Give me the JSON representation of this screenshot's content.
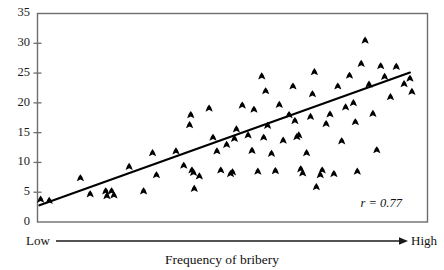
{
  "chart_data": {
    "type": "scatter",
    "title": "",
    "xlabel": "Frequency of bribery",
    "ylabel": "",
    "xlim": [
      0,
      100
    ],
    "ylim": [
      0,
      35
    ],
    "grid": false,
    "legend": null,
    "x_axis_low_label": "Low",
    "x_axis_high_label": "High",
    "y_ticks": [
      0,
      5,
      10,
      15,
      20,
      25,
      30,
      35
    ],
    "y_tick_labels": [
      "0",
      "5",
      "10",
      "15",
      "20",
      "25",
      "30",
      "35"
    ],
    "annotations": [
      {
        "name": "correlation",
        "text": "r = 0.77",
        "value": 0.77
      }
    ],
    "trendline": {
      "type": "linear",
      "x_start": 0.5,
      "y_start": 2.8,
      "x_end": 95.5,
      "y_end": 25.1
    },
    "points": [
      {
        "x": 0.8,
        "y": 3.8
      },
      {
        "x": 3.0,
        "y": 3.6
      },
      {
        "x": 11.0,
        "y": 7.4
      },
      {
        "x": 13.5,
        "y": 4.7
      },
      {
        "x": 17.5,
        "y": 5.2
      },
      {
        "x": 17.8,
        "y": 4.4
      },
      {
        "x": 19.0,
        "y": 5.2
      },
      {
        "x": 19.6,
        "y": 4.5
      },
      {
        "x": 23.5,
        "y": 9.3
      },
      {
        "x": 27.2,
        "y": 5.2
      },
      {
        "x": 29.5,
        "y": 11.6
      },
      {
        "x": 30.5,
        "y": 7.9
      },
      {
        "x": 35.5,
        "y": 11.9
      },
      {
        "x": 37.5,
        "y": 9.5
      },
      {
        "x": 39.0,
        "y": 16.3
      },
      {
        "x": 39.3,
        "y": 18.0
      },
      {
        "x": 39.6,
        "y": 8.7
      },
      {
        "x": 40.0,
        "y": 8.3
      },
      {
        "x": 40.2,
        "y": 5.6
      },
      {
        "x": 41.5,
        "y": 7.7
      },
      {
        "x": 44.0,
        "y": 19.1
      },
      {
        "x": 45.0,
        "y": 14.2
      },
      {
        "x": 46.0,
        "y": 11.9
      },
      {
        "x": 47.0,
        "y": 8.7
      },
      {
        "x": 48.5,
        "y": 13.0
      },
      {
        "x": 49.5,
        "y": 8.1
      },
      {
        "x": 50.0,
        "y": 8.4
      },
      {
        "x": 50.5,
        "y": 14.0
      },
      {
        "x": 51.0,
        "y": 15.6
      },
      {
        "x": 52.5,
        "y": 19.6
      },
      {
        "x": 54.0,
        "y": 14.6
      },
      {
        "x": 55.0,
        "y": 12.0
      },
      {
        "x": 55.5,
        "y": 18.9
      },
      {
        "x": 56.5,
        "y": 8.5
      },
      {
        "x": 57.5,
        "y": 24.5
      },
      {
        "x": 58.0,
        "y": 14.2
      },
      {
        "x": 58.5,
        "y": 22.0
      },
      {
        "x": 59.0,
        "y": 16.2
      },
      {
        "x": 60.0,
        "y": 11.5
      },
      {
        "x": 61.0,
        "y": 8.6
      },
      {
        "x": 62.0,
        "y": 19.7
      },
      {
        "x": 63.0,
        "y": 13.7
      },
      {
        "x": 64.5,
        "y": 18.0
      },
      {
        "x": 65.5,
        "y": 22.8
      },
      {
        "x": 66.0,
        "y": 17.0
      },
      {
        "x": 66.5,
        "y": 14.3
      },
      {
        "x": 67.0,
        "y": 14.6
      },
      {
        "x": 67.5,
        "y": 8.9
      },
      {
        "x": 68.0,
        "y": 8.2
      },
      {
        "x": 69.0,
        "y": 11.6
      },
      {
        "x": 70.0,
        "y": 17.7
      },
      {
        "x": 70.5,
        "y": 21.5
      },
      {
        "x": 71.0,
        "y": 25.2
      },
      {
        "x": 71.5,
        "y": 5.9
      },
      {
        "x": 72.5,
        "y": 7.9
      },
      {
        "x": 73.0,
        "y": 8.7
      },
      {
        "x": 74.0,
        "y": 16.5
      },
      {
        "x": 75.0,
        "y": 18.1
      },
      {
        "x": 76.0,
        "y": 8.1
      },
      {
        "x": 77.0,
        "y": 22.8
      },
      {
        "x": 78.0,
        "y": 13.6
      },
      {
        "x": 79.0,
        "y": 19.3
      },
      {
        "x": 80.0,
        "y": 24.6
      },
      {
        "x": 81.0,
        "y": 20.0
      },
      {
        "x": 81.5,
        "y": 16.8
      },
      {
        "x": 82.0,
        "y": 8.5
      },
      {
        "x": 83.0,
        "y": 26.6
      },
      {
        "x": 84.0,
        "y": 30.5
      },
      {
        "x": 85.0,
        "y": 23.1
      },
      {
        "x": 86.0,
        "y": 18.2
      },
      {
        "x": 87.0,
        "y": 12.1
      },
      {
        "x": 88.0,
        "y": 26.2
      },
      {
        "x": 89.0,
        "y": 24.4
      },
      {
        "x": 90.5,
        "y": 21.0
      },
      {
        "x": 92.0,
        "y": 26.1
      },
      {
        "x": 94.0,
        "y": 23.2
      },
      {
        "x": 95.5,
        "y": 24.1
      },
      {
        "x": 96.0,
        "y": 21.9
      }
    ]
  }
}
